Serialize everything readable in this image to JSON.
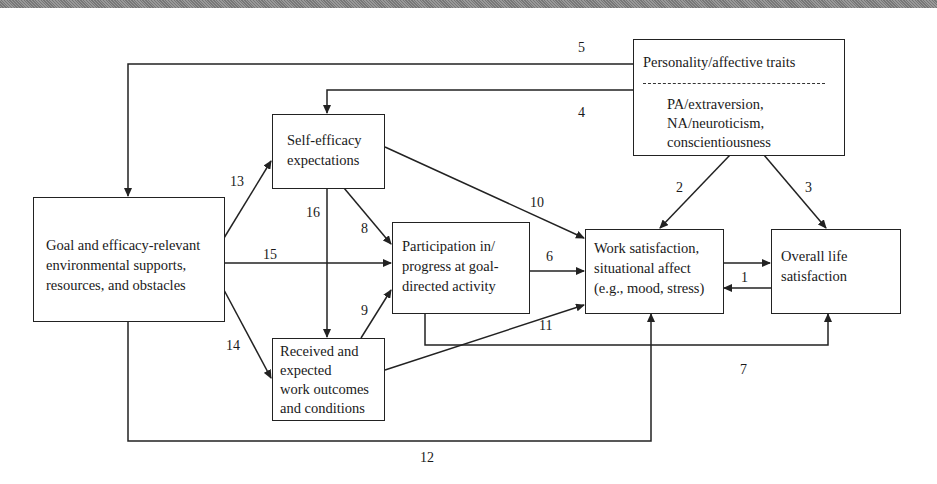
{
  "diagram": {
    "nodes": {
      "personality": {
        "title": "Personality/affective traits",
        "lines": [
          "PA/extraversion,",
          "NA/neuroticism,",
          "conscientiousness"
        ]
      },
      "self_efficacy": {
        "lines": [
          "Self-efficacy",
          "expectations"
        ]
      },
      "goal_supports": {
        "lines": [
          "Goal and efficacy-relevant",
          "environmental supports,",
          "resources, and obstacles"
        ]
      },
      "participation": {
        "lines": [
          "Participation in/",
          "progress at goal-",
          "directed activity"
        ]
      },
      "received_outcomes": {
        "lines": [
          "Received and",
          "expected",
          "work outcomes",
          "and conditions"
        ]
      },
      "work_satisfaction": {
        "lines": [
          "Work satisfaction,",
          "situational affect",
          "(e.g., mood, stress)"
        ]
      },
      "life_satisfaction": {
        "lines": [
          "Overall life",
          "satisfaction"
        ]
      }
    },
    "paths": [
      {
        "label": "1",
        "from": "work_satisfaction",
        "to": "life_satisfaction",
        "bidirectional": true
      },
      {
        "label": "2",
        "from": "personality",
        "to": "work_satisfaction"
      },
      {
        "label": "3",
        "from": "personality",
        "to": "life_satisfaction"
      },
      {
        "label": "4",
        "from": "personality",
        "to": "self_efficacy"
      },
      {
        "label": "5",
        "from": "personality",
        "to": "goal_supports"
      },
      {
        "label": "6",
        "from": "participation",
        "to": "work_satisfaction"
      },
      {
        "label": "7",
        "from": "participation",
        "to": "life_satisfaction"
      },
      {
        "label": "8",
        "from": "self_efficacy",
        "to": "participation"
      },
      {
        "label": "9",
        "from": "received_outcomes",
        "to": "participation"
      },
      {
        "label": "10",
        "from": "self_efficacy",
        "to": "work_satisfaction"
      },
      {
        "label": "11",
        "from": "received_outcomes",
        "to": "work_satisfaction"
      },
      {
        "label": "12",
        "from": "goal_supports",
        "to": "work_satisfaction"
      },
      {
        "label": "13",
        "from": "goal_supports",
        "to": "self_efficacy"
      },
      {
        "label": "14",
        "from": "goal_supports",
        "to": "received_outcomes"
      },
      {
        "label": "15",
        "from": "goal_supports",
        "to": "participation"
      },
      {
        "label": "16",
        "from": "self_efficacy",
        "to": "received_outcomes"
      }
    ],
    "colors": {
      "line": "#222222",
      "background": "#ffffff"
    }
  }
}
